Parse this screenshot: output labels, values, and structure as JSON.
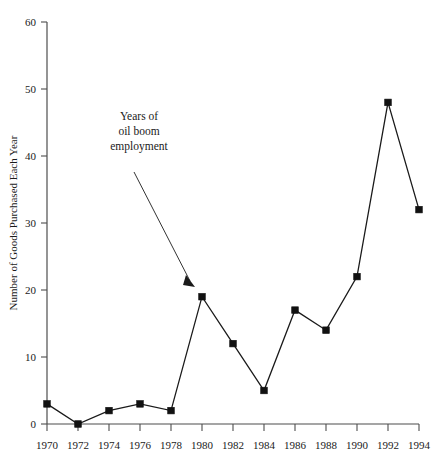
{
  "chart_data": {
    "type": "line",
    "title": "",
    "subtitle": "",
    "xlabel": "",
    "ylabel": "Number of Goods Purchased Each Year",
    "x": [
      1970,
      1972,
      1974,
      1976,
      1978,
      1980,
      1982,
      1984,
      1986,
      1988,
      1990,
      1992,
      1994
    ],
    "values": [
      3,
      0,
      2,
      3,
      2,
      19,
      12,
      5,
      17,
      14,
      22,
      48,
      32
    ],
    "categories": [
      "1970",
      "1972",
      "1974",
      "1976",
      "1978",
      "1980",
      "1982",
      "1984",
      "1986",
      "1988",
      "1990",
      "1992",
      "1994"
    ],
    "xlim": [
      1970,
      1994
    ],
    "ylim": [
      0,
      60
    ],
    "ytick_labels": [
      "0",
      "10",
      "20",
      "30",
      "40",
      "50",
      "60"
    ],
    "ytick_values": [
      0,
      10,
      20,
      30,
      40,
      50,
      60
    ],
    "xtick_labels": [
      "1970",
      "1972",
      "1974",
      "1976",
      "1978",
      "1980",
      "1982",
      "1984",
      "1986",
      "1988",
      "1990",
      "1992",
      "1994"
    ],
    "grid": false,
    "legend": null,
    "marker": "square",
    "line_color": "#1a1a1a",
    "marker_color": "#111111",
    "annotations": [
      {
        "name": "oil-boom-annotation",
        "lines": [
          "Years of",
          "oil boom",
          "employment"
        ],
        "points_to_x": 1979,
        "points_to_y": 21
      }
    ]
  }
}
